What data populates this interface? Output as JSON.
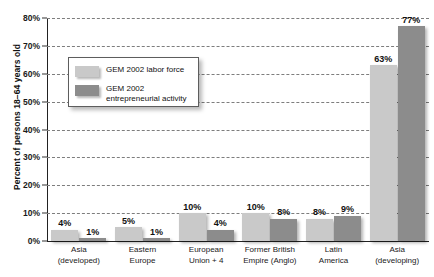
{
  "chart_data": {
    "type": "bar",
    "title": "",
    "xlabel": "",
    "ylabel": "Percent of persons 18–64 years old",
    "ylim": [
      0,
      80
    ],
    "ytick_step": 10,
    "ytick_labels": [
      "0%",
      "10%",
      "20%",
      "30%",
      "40%",
      "50%",
      "60%",
      "70%",
      "80%"
    ],
    "grid": true,
    "legend_position": "upper-left-inside",
    "categories": [
      "Asia (developed)",
      "Eastern Europe",
      "European Union + 4",
      "Former British Empire (Anglo)",
      "Latin America",
      "Asia (developing)"
    ],
    "category_lines": [
      [
        "Asia",
        "(developed)"
      ],
      [
        "Eastern",
        "Europe"
      ],
      [
        "European",
        "Union + 4"
      ],
      [
        "Former British",
        "Empire (Anglo)"
      ],
      [
        "Latin",
        "America"
      ],
      [
        "Asia",
        "(developing)"
      ]
    ],
    "series": [
      {
        "name": "GEM 2002 labor force",
        "color": "#c9c9c9",
        "values": [
          4,
          5,
          10,
          10,
          8,
          63
        ],
        "labels": [
          "4%",
          "5%",
          "10%",
          "10%",
          "8%",
          "63%"
        ]
      },
      {
        "name": "GEM 2002 entrepreneurial activity",
        "color": "#8c8c8c",
        "values": [
          1,
          1,
          4,
          8,
          9,
          77
        ],
        "labels": [
          "1%",
          "1%",
          "4%",
          "8%",
          "9%",
          "77%"
        ]
      }
    ]
  },
  "legend": {
    "items": [
      {
        "swatch": "light",
        "lines": [
          "GEM 2002 labor force"
        ]
      },
      {
        "swatch": "dark",
        "lines": [
          "GEM 2002",
          "entrepreneurial activity"
        ]
      }
    ]
  },
  "colors": {
    "labor_force": "#c9c9c9",
    "entrepreneurial_activity": "#8c8c8c",
    "axis": "#222222",
    "grid": "#7d7d7d",
    "background": "#ffffff"
  }
}
